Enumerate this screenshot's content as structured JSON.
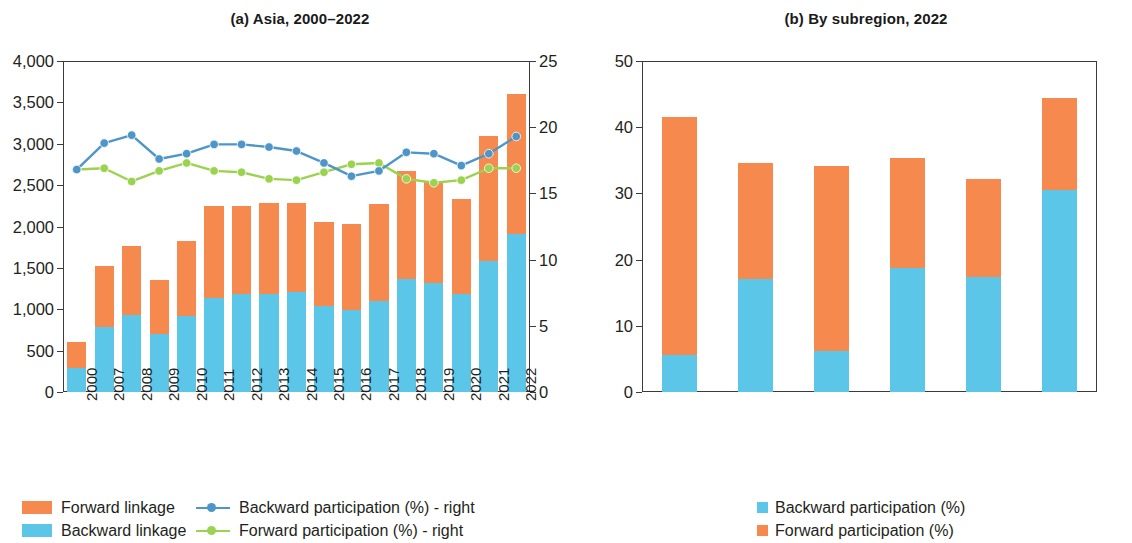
{
  "figure": {
    "panel_a_title": "(a) Asia, 2000–2022",
    "panel_b_title": "(b) By subregion, 2022"
  },
  "colors": {
    "forward_linkage": "#f68a4e",
    "backward_linkage": "#5bc6e8",
    "backward_participation_line": "#4e96c8",
    "forward_participation_line": "#9bd24f",
    "axis": "#3b3b3b"
  },
  "legend_a": {
    "items": [
      {
        "label": "Forward linkage",
        "marker": "square",
        "color": "#f68a4e"
      },
      {
        "label": "Backward linkage",
        "marker": "square",
        "color": "#5bc6e8"
      },
      {
        "label": "Backward participation (%) - right",
        "marker": "line-dot",
        "color": "#4e96c8"
      },
      {
        "label": "Forward participation (%) - right",
        "marker": "line-dot",
        "color": "#9bd24f"
      }
    ]
  },
  "legend_b": {
    "items": [
      {
        "label": "Backward participation (%)",
        "marker": "square",
        "color": "#5bc6e8"
      },
      {
        "label": "Forward participation (%)",
        "marker": "square",
        "color": "#f68a4e"
      }
    ]
  },
  "chart_data": [
    {
      "id": "panel_a",
      "type": "bar",
      "title": "(a) Asia, 2000–2022",
      "xlabel": "",
      "ylabel": "",
      "ylim": [
        0,
        4000
      ],
      "y_ticks": [
        0,
        500,
        1000,
        1500,
        2000,
        2500,
        3000,
        3500,
        4000
      ],
      "y_tick_labels": [
        "0",
        "500",
        "1,000",
        "1,500",
        "2,000",
        "2,500",
        "3,000",
        "3,500",
        "4,000"
      ],
      "y2lim": [
        0,
        25
      ],
      "y2_ticks": [
        0,
        5,
        10,
        15,
        20,
        25
      ],
      "y2_tick_labels": [
        "0",
        "5",
        "10",
        "15",
        "20",
        "25"
      ],
      "grid": false,
      "legend_position": "below-left",
      "stacked": true,
      "categories": [
        "2000",
        "2007",
        "2008",
        "2009",
        "2010",
        "2011",
        "2012",
        "2013",
        "2014",
        "2015",
        "2016",
        "2017",
        "2018",
        "2019",
        "2020",
        "2021",
        "2022"
      ],
      "series": [
        {
          "name": "Backward linkage",
          "axis": "left",
          "kind": "bar",
          "values": [
            290,
            780,
            930,
            700,
            920,
            1140,
            1180,
            1190,
            1210,
            1040,
            990,
            1100,
            1370,
            1320,
            1190,
            1580,
            1910
          ]
        },
        {
          "name": "Forward linkage",
          "axis": "left",
          "kind": "bar",
          "values": [
            310,
            740,
            840,
            650,
            910,
            1110,
            1070,
            1090,
            1080,
            1010,
            1040,
            1170,
            1300,
            1230,
            1140,
            1520,
            1690
          ]
        },
        {
          "name": "Backward participation (%) - right",
          "axis": "right",
          "kind": "line",
          "values": [
            16.8,
            18.8,
            19.4,
            17.6,
            18.0,
            18.7,
            18.7,
            18.5,
            18.2,
            17.3,
            16.3,
            16.7,
            18.1,
            18.0,
            17.1,
            18.0,
            19.3
          ]
        },
        {
          "name": "Forward participation (%) - right",
          "axis": "right",
          "kind": "line",
          "values": [
            16.8,
            16.9,
            15.9,
            16.7,
            17.3,
            16.7,
            16.6,
            16.1,
            16.0,
            16.6,
            17.2,
            17.3,
            16.1,
            15.8,
            16.0,
            16.9,
            16.9
          ]
        }
      ]
    },
    {
      "id": "panel_b",
      "type": "bar",
      "title": "(b) By subregion, 2022",
      "xlabel": "",
      "ylabel": "",
      "ylim": [
        0,
        50
      ],
      "y_ticks": [
        0,
        10,
        20,
        30,
        40,
        50
      ],
      "y_tick_labels": [
        "0",
        "10",
        "20",
        "30",
        "40",
        "50"
      ],
      "grid": false,
      "legend_position": "below-center",
      "stacked": true,
      "categories": [
        "Central Asia",
        "East Asia",
        "Oceania",
        "Pacific",
        "South Asia",
        "Southeast Asia"
      ],
      "category_lines": [
        [
          "Central",
          "Asia"
        ],
        [
          "East",
          "Asia"
        ],
        [
          "Oceania",
          ""
        ],
        [
          "Pacific",
          ""
        ],
        [
          "South",
          "Asia"
        ],
        [
          "Southeast",
          "Asia"
        ]
      ],
      "series": [
        {
          "name": "Backward participation (%)",
          "values": [
            5.6,
            17.0,
            6.2,
            18.7,
            17.3,
            30.5
          ]
        },
        {
          "name": "Forward participation (%)",
          "values": [
            36.0,
            17.6,
            27.9,
            16.7,
            14.9,
            13.9
          ]
        }
      ],
      "totals": [
        41.6,
        34.6,
        34.1,
        35.4,
        32.2,
        44.4
      ]
    }
  ]
}
